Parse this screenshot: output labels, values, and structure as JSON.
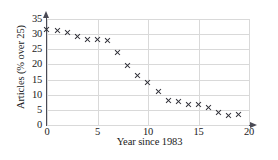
{
  "chart_data": {
    "type": "scatter",
    "title": "",
    "xlabel": "Year since 1983",
    "ylabel": "Articles (% over 25)",
    "xlim": [
      0,
      20
    ],
    "ylim": [
      0,
      35
    ],
    "xticks": [
      0,
      5,
      10,
      15,
      20
    ],
    "yticks": [
      0,
      5,
      10,
      15,
      20,
      25,
      30,
      35
    ],
    "grid": true,
    "legend": null,
    "marker": "x",
    "marker_color": "#2b2b33",
    "x": [
      0,
      1,
      2,
      3,
      4,
      5,
      6,
      7,
      8,
      9,
      10,
      11,
      12,
      13,
      14,
      15,
      16,
      17,
      18,
      19
    ],
    "values": [
      31.5,
      31.3,
      30.6,
      29.2,
      28.3,
      28.2,
      27.8,
      24.1,
      19.5,
      16.5,
      14.1,
      11.1,
      8.0,
      7.7,
      6.9,
      6.8,
      5.9,
      4.0,
      3.0,
      3.5
    ]
  },
  "axes": {
    "y_tick_labels": [
      "0",
      "5",
      "10",
      "15",
      "20",
      "25",
      "30",
      "35"
    ],
    "x_tick_labels": [
      "0",
      "5",
      "10",
      "15",
      "20"
    ]
  },
  "colors": {
    "axis": "#4a4a55",
    "grid": "#d9d9d9",
    "marker": "#2b2b33",
    "background": "#ffffff"
  }
}
